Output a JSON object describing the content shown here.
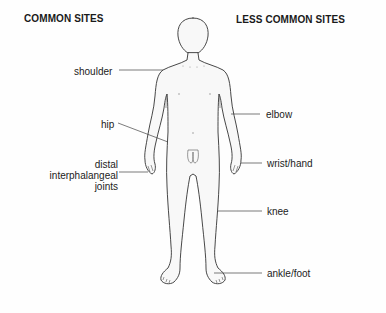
{
  "headings": {
    "common": "COMMON SITES",
    "less_common": "LESS COMMON SITES"
  },
  "common_sites": [
    {
      "label": "shoulder"
    },
    {
      "label": "hip"
    },
    {
      "label_lines": [
        "distal",
        "interphalangeal",
        "joints"
      ]
    }
  ],
  "less_common_sites": [
    {
      "label": "elbow"
    },
    {
      "label": "wrist/hand"
    },
    {
      "label": "knee"
    },
    {
      "label": "ankle/foot"
    }
  ],
  "colors": {
    "outline": "#333333",
    "leader_line": "#555555",
    "body_fill": "#f7f7f7",
    "text": "#1a1a1a"
  }
}
